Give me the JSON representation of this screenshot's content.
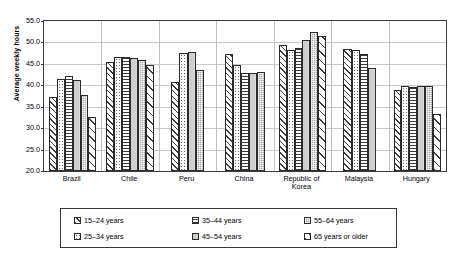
{
  "chart_data": {
    "type": "bar",
    "title": "",
    "xlabel": "",
    "ylabel": "Average weekly hours",
    "ylim": [
      20.0,
      55.0
    ],
    "ytick_step": 5.0,
    "yticks": [
      "55.0",
      "50.0",
      "45.0",
      "40.0",
      "35.0",
      "30.0",
      "25.0",
      "20.0"
    ],
    "grid": true,
    "legend_position": "bottom",
    "categories": [
      "Brazil",
      "Chile",
      "Peru",
      "China",
      "Republic of\nKorea",
      "Malaysia",
      "Hungary"
    ],
    "series": [
      {
        "name": "15–24 years",
        "values": [
          37.3,
          45.4,
          40.7,
          47.3,
          49.5,
          48.5,
          38.8
        ]
      },
      {
        "name": "25–34 years",
        "values": [
          41.4,
          46.5,
          47.6,
          44.8,
          48.3,
          48.2,
          39.8
        ]
      },
      {
        "name": "35–44 years",
        "values": [
          42.1,
          46.5,
          null,
          42.8,
          48.8,
          47.3,
          39.7
        ]
      },
      {
        "name": "45–54 years",
        "values": [
          41.3,
          46.4,
          47.8,
          42.9,
          50.5,
          44.0,
          39.8
        ]
      },
      {
        "name": "55–64 years",
        "values": [
          37.7,
          46.0,
          43.5,
          43.0,
          52.5,
          null,
          39.8
        ]
      },
      {
        "name": "65 years or older",
        "values": [
          32.5,
          44.8,
          null,
          null,
          51.6,
          null,
          33.3
        ]
      }
    ]
  },
  "legend": {
    "items": [
      {
        "label": "15–24 years"
      },
      {
        "label": "35–44 years"
      },
      {
        "label": "55–64 years"
      },
      {
        "label": "25–34 years"
      },
      {
        "label": "45–54 years"
      },
      {
        "label": "65 years or older"
      }
    ]
  },
  "colors": {
    "axis": "#3a3a3a",
    "grid": "#c9c9c9",
    "bar_outline": "#2b2b2b",
    "background": "#ffffff"
  }
}
